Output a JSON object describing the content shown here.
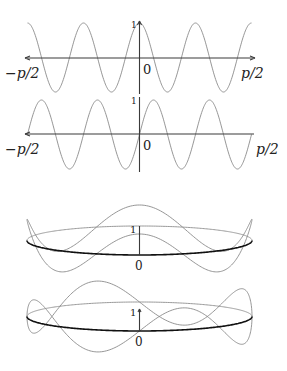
{
  "figure": {
    "panels": [
      {
        "id": "flat-cos",
        "function": "cos(8x)",
        "x_range": [
          "-π/2",
          "π/2"
        ],
        "labels": {
          "left": "−p/2",
          "right": "p/2",
          "origin": "0",
          "y_tick": "1"
        },
        "periods": 4
      },
      {
        "id": "flat-sin",
        "function": "sin(8x)",
        "x_range": [
          "-π/2",
          "π/2"
        ],
        "labels": {
          "left": "−p/2",
          "right": "p/2",
          "origin": "0",
          "y_tick": "1"
        },
        "periods": 4
      },
      {
        "id": "circle-cos",
        "function": "cos(4θ) on circle",
        "labels": {
          "origin": "0",
          "y_tick": "1"
        }
      },
      {
        "id": "circle-sin",
        "function": "sin(4θ) on circle",
        "labels": {
          "origin": "0",
          "y_tick": "1"
        }
      }
    ],
    "colors": {
      "curve": "#8a8a8a",
      "axis": "#3a3a3a",
      "ellipse_front": "#111111"
    }
  }
}
